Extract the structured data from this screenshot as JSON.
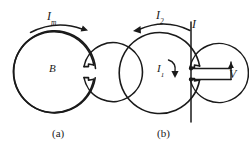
{
  "figure": {
    "background_color": "#ffffff",
    "stroke_color": "#1a1a1a",
    "panels": [
      {
        "id": "a",
        "caption": "(a)",
        "labels": {
          "current_arc": {
            "symbol": "I",
            "subscript": "m"
          },
          "field": {
            "symbol": "B",
            "subscript": ""
          }
        },
        "arc_arrow_direction": "clockwise"
      },
      {
        "id": "b",
        "caption": "(b)",
        "labels": {
          "outer_current_arc": {
            "symbol": "I",
            "subscript": "2"
          },
          "inner_current_arc": {
            "symbol": "I",
            "subscript": "1"
          },
          "lead_current": {
            "symbol": "I",
            "subscript": ""
          },
          "voltage": {
            "symbol": "V",
            "subscript": ""
          }
        },
        "arc_arrow_direction": "counterclockwise"
      }
    ]
  },
  "labels": {
    "i_m": "I",
    "i_m_sub": "m",
    "b": "B",
    "caption_a": "(a)",
    "i2": "I",
    "i2_sub": "2",
    "i1": "I",
    "i1_sub": "1",
    "i": "I",
    "v": "V",
    "caption_b": "(b)"
  }
}
